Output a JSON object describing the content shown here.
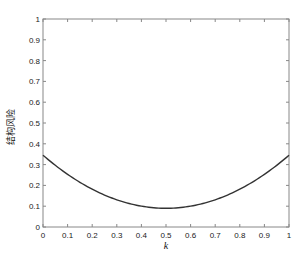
{
  "chart_data": {
    "type": "line",
    "title": "",
    "xlabel": "k",
    "ylabel": "结构风险",
    "xlim": [
      0,
      1
    ],
    "ylim": [
      0,
      1
    ],
    "grid": false,
    "legend": null,
    "x_ticks": [
      "0",
      "0.1",
      "0.2",
      "0.3",
      "0.4",
      "0.5",
      "0.6",
      "0.7",
      "0.8",
      "0.9",
      "1"
    ],
    "y_ticks": [
      "0",
      "0.1",
      "0.2",
      "0.3",
      "0.4",
      "0.5",
      "0.6",
      "0.7",
      "0.8",
      "0.9",
      "1"
    ],
    "series": [
      {
        "name": "结构风险",
        "color": "#333333",
        "x": [
          0,
          0.1,
          0.2,
          0.3,
          0.4,
          0.5,
          0.6,
          0.7,
          0.8,
          0.9,
          1.0
        ],
        "y": [
          0.345,
          0.26,
          0.19,
          0.14,
          0.1,
          0.09,
          0.1,
          0.14,
          0.19,
          0.26,
          0.345
        ]
      }
    ]
  },
  "layout": {
    "plot": {
      "left": 43,
      "top": 19,
      "right": 289,
      "bottom": 227
    },
    "axis_color": "#888888",
    "line_color": "#333333"
  }
}
